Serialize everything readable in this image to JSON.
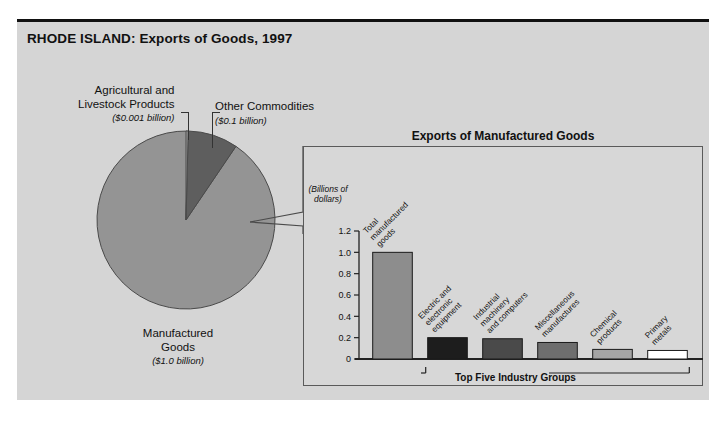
{
  "figure": {
    "title": "RHODE ISLAND: Exports of Goods, 1997"
  },
  "pie": {
    "slices": [
      {
        "name": "Agricultural and Livestock Products",
        "label_line1": "Agricultural and",
        "label_line2": "Livestock Products",
        "amount": "($0.001 billion)",
        "value": 0.001,
        "color": "#9a9a9a"
      },
      {
        "name": "Other Commodities",
        "label_line1": "Other Commodities",
        "label_line2": "",
        "amount": "($0.1 billion)",
        "value": 0.1,
        "color": "#5e5e5e"
      },
      {
        "name": "Manufactured Goods",
        "label_line1": "Manufactured",
        "label_line2": "Goods",
        "amount": "($1.0 billion)",
        "value": 1.0,
        "color": "#949494"
      }
    ]
  },
  "bar_panel": {
    "title": "Exports of Manufactured Goods",
    "axis_caption_line1": "(Billions of",
    "axis_caption_line2": "dollars)",
    "bracket_label": "Top Five Industry Groups"
  },
  "chart_data": {
    "type": "bar",
    "title": "Exports of Manufactured Goods",
    "xlabel": "",
    "ylabel": "(Billions of dollars)",
    "ylim": [
      0,
      1.2
    ],
    "yticks": [
      "0",
      "0.2",
      "0.4",
      "0.6",
      "0.8",
      "1.0",
      "1.2"
    ],
    "ytick_values": [
      0,
      0.2,
      0.4,
      0.6,
      0.8,
      1.0,
      1.2
    ],
    "grid": false,
    "legend": "none",
    "categories": [
      "Total manufactured goods",
      "Electric and electronic equipment",
      "Industrial machinery and computers",
      "Miscellaneous manufactures",
      "Chemical products",
      "Primary metals"
    ],
    "category_lines": [
      [
        "Total",
        "manufactured",
        "goods"
      ],
      [
        "Electric and",
        "electronic",
        "equipment"
      ],
      [
        "Industrial",
        "machinery",
        "and computers"
      ],
      [
        "Miscellaneous",
        "manufactures"
      ],
      [
        "Chemical",
        "products"
      ],
      [
        "Primary",
        "metals"
      ]
    ],
    "values": [
      1.0,
      0.2,
      0.19,
      0.155,
      0.09,
      0.08
    ],
    "colors": [
      "#8d8d8d",
      "#1d1d1d",
      "#4a4a4a",
      "#6e6e6e",
      "#a5a5a5",
      "#ffffff"
    ],
    "annotations": [
      "Top Five Industry Groups"
    ]
  }
}
